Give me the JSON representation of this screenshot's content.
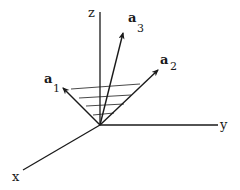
{
  "diagram": {
    "title": "",
    "origin": [
      100,
      125
    ],
    "axes": [
      {
        "id": "z",
        "label": "z",
        "end": [
          100,
          12
        ],
        "label_pos": [
          88,
          17
        ]
      },
      {
        "id": "y",
        "label": "y",
        "end": [
          218,
          125
        ],
        "label_pos": [
          220,
          129
        ]
      },
      {
        "id": "x",
        "label": "x",
        "end": [
          23,
          170
        ],
        "label_pos": [
          12,
          181
        ]
      }
    ],
    "vectors": [
      {
        "id": "a1",
        "base": "a",
        "sub": "1",
        "end": [
          63,
          88
        ],
        "label_pos": [
          44,
          83
        ],
        "sub_pos": [
          53,
          92
        ]
      },
      {
        "id": "a2",
        "base": "a",
        "sub": "2",
        "end": [
          158,
          70
        ],
        "label_pos": [
          160,
          64
        ],
        "sub_pos": [
          170,
          70
        ]
      },
      {
        "id": "a3",
        "base": "a",
        "sub": "3",
        "end": [
          123,
          33
        ],
        "label_pos": [
          128,
          22
        ],
        "sub_pos": [
          137,
          32
        ]
      }
    ],
    "hatch_lines": [
      [
        [
          71,
          89
        ],
        [
          140,
          84
        ]
      ],
      [
        [
          79,
          98
        ],
        [
          131,
          95
        ]
      ],
      [
        [
          86,
          106
        ],
        [
          124,
          104
        ]
      ],
      [
        [
          93,
          115
        ],
        [
          114,
          113
        ]
      ]
    ],
    "colors": {
      "stroke": "#1a1a1a",
      "background": "#ffffff"
    }
  }
}
